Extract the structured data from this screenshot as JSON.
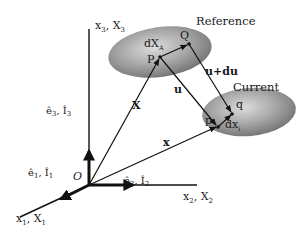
{
  "diagram": {
    "title_reference": "Reference",
    "title_current": "Current",
    "origin": "O",
    "axes": {
      "x1": {
        "label_main": "x",
        "sub_main": "1",
        "sep": ", ",
        "label_cap": "X",
        "sub_cap": "1"
      },
      "x2": {
        "label_main": "x",
        "sub_main": "2",
        "sep": ", ",
        "label_cap": "X",
        "sub_cap": "2"
      },
      "x3": {
        "label_main": "x",
        "sub_main": "3",
        "sep": ", ",
        "label_cap": "X",
        "sub_cap": "3"
      }
    },
    "basis": {
      "e1": {
        "e": "ê",
        "sub_e": "1",
        "sep": ", ",
        "I": "Î",
        "sub_I": "1"
      },
      "e2": {
        "e": "ê",
        "sub_e": "2",
        "sep": ", ",
        "I": "Î",
        "sub_I": "2"
      },
      "e3": {
        "e": "ê",
        "sub_e": "3",
        "sep": ", ",
        "I": "Î",
        "sub_I": "3"
      }
    },
    "points": {
      "P": "P",
      "Q": "Q",
      "p": "p",
      "q": "q"
    },
    "vectors": {
      "X": "X",
      "x": "x",
      "u": "u",
      "u_du": "u+du",
      "dX": {
        "d": "d",
        "X": "X",
        "sub": "A"
      },
      "dx": {
        "d": "d",
        "x": "x",
        "sub": "i"
      }
    },
    "colors": {
      "line": "#111111",
      "ellipse_light": "#d9d9d9",
      "ellipse_dark": "#7a7a7a",
      "text": "#1a1a1a"
    }
  }
}
